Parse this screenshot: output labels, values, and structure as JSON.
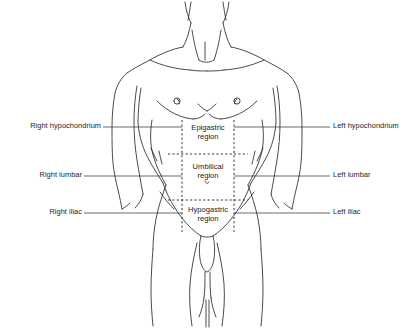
{
  "figure": {
    "background_color": "#ffffff",
    "line_color": "#2a2a2a",
    "text_color": "#1b1b1b"
  },
  "left_labels": [
    {
      "id": "right-hypochondrium",
      "text": "Right hypochondrium"
    },
    {
      "id": "right-lumbar",
      "text": "Right lumbar"
    },
    {
      "id": "right-iliac",
      "text": "Right iliac"
    }
  ],
  "right_labels": [
    {
      "id": "left-hypochondrium",
      "text": "Left hypochondrium"
    },
    {
      "id": "left-lumbar",
      "text": "Left lumbar"
    },
    {
      "id": "left-iliac",
      "text": "Left iliac"
    }
  ],
  "center_labels": [
    {
      "id": "epigastric-region",
      "line1": "Epigastric",
      "line2": "region"
    },
    {
      "id": "umbilical-region",
      "line1": "Umbilical",
      "line2": "region"
    },
    {
      "id": "hypogastric-region",
      "line1": "Hypogastric",
      "line2": "region"
    }
  ]
}
